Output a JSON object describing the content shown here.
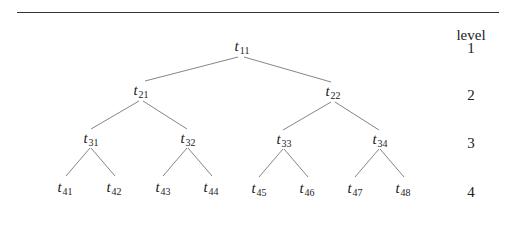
{
  "header": {
    "level_label": "level"
  },
  "levels": [
    "1",
    "2",
    "3",
    "4"
  ],
  "nodes": {
    "t11": {
      "base": "t",
      "sub": "11"
    },
    "t21": {
      "base": "t",
      "sub": "21"
    },
    "t22": {
      "base": "t",
      "sub": "22"
    },
    "t31": {
      "base": "t",
      "sub": "31"
    },
    "t32": {
      "base": "t",
      "sub": "32"
    },
    "t33": {
      "base": "t",
      "sub": "33"
    },
    "t34": {
      "base": "t",
      "sub": "34"
    },
    "t41": {
      "base": "t",
      "sub": "41"
    },
    "t42": {
      "base": "t",
      "sub": "42"
    },
    "t43": {
      "base": "t",
      "sub": "43"
    },
    "t44": {
      "base": "t",
      "sub": "44"
    },
    "t45": {
      "base": "t",
      "sub": "45"
    },
    "t46": {
      "base": "t",
      "sub": "46"
    },
    "t47": {
      "base": "t",
      "sub": "47"
    },
    "t48": {
      "base": "t",
      "sub": "48"
    }
  },
  "edges": [
    [
      "t11",
      "t21"
    ],
    [
      "t11",
      "t22"
    ],
    [
      "t21",
      "t31"
    ],
    [
      "t21",
      "t32"
    ],
    [
      "t22",
      "t33"
    ],
    [
      "t22",
      "t34"
    ],
    [
      "t31",
      "t41"
    ],
    [
      "t31",
      "t42"
    ],
    [
      "t32",
      "t43"
    ],
    [
      "t32",
      "t44"
    ],
    [
      "t33",
      "t45"
    ],
    [
      "t33",
      "t46"
    ],
    [
      "t34",
      "t47"
    ],
    [
      "t34",
      "t48"
    ]
  ],
  "colors": {
    "line": "#555555",
    "text": "#222222"
  }
}
